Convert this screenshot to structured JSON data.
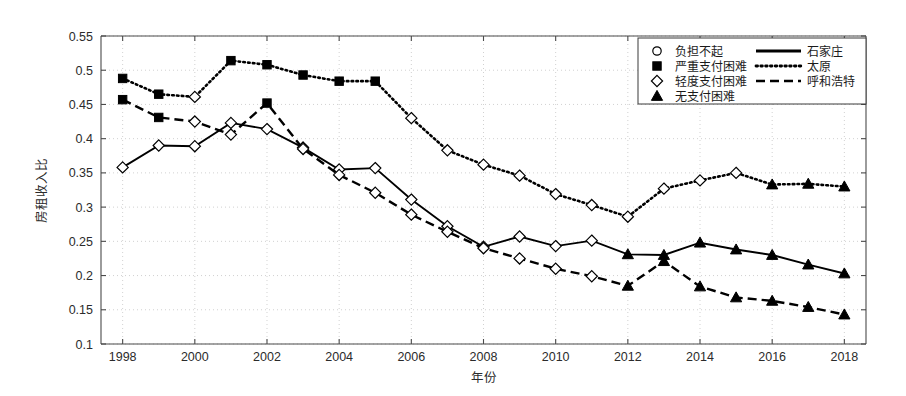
{
  "chart_data": {
    "type": "line",
    "title": "",
    "xlabel": "年份",
    "ylabel": "房租收入比",
    "xlim": [
      1997.4,
      2018.6
    ],
    "ylim": [
      0.1,
      0.55
    ],
    "xticks": [
      "1998",
      "2000",
      "2002",
      "2004",
      "2006",
      "2008",
      "2010",
      "2012",
      "2014",
      "2016",
      "2018"
    ],
    "yticks": [
      "0.1",
      "0.15",
      "0.2",
      "0.25",
      "0.3",
      "0.35",
      "0.4",
      "0.45",
      "0.5",
      "0.55"
    ],
    "grid": true,
    "grid_style": "dotted",
    "legend_position": "top-right",
    "x": [
      1998,
      1999,
      2000,
      2001,
      2002,
      2003,
      2004,
      2005,
      2006,
      2007,
      2008,
      2009,
      2010,
      2011,
      2012,
      2013,
      2014,
      2015,
      2016,
      2017,
      2018
    ],
    "series": [
      {
        "name": "石家庄",
        "line_style": "solid",
        "color": "#000000",
        "values": [
          0.358,
          0.39,
          0.389,
          0.423,
          0.414,
          0.387,
          0.355,
          0.357,
          0.311,
          0.272,
          0.242,
          0.257,
          0.243,
          0.251,
          0.231,
          0.23,
          0.248,
          0.238,
          0.23,
          0.216,
          0.203
        ],
        "markers": [
          "diamond",
          "diamond",
          "diamond",
          "diamond",
          "diamond",
          "diamond",
          "diamond",
          "diamond",
          "diamond",
          "diamond",
          "diamond",
          "diamond",
          "diamond",
          "diamond",
          "triangle",
          "triangle",
          "triangle",
          "triangle",
          "triangle",
          "triangle",
          "triangle"
        ]
      },
      {
        "name": "太原",
        "line_style": "dotted",
        "color": "#000000",
        "values": [
          0.488,
          0.465,
          0.461,
          0.514,
          0.508,
          0.493,
          0.484,
          0.484,
          0.43,
          0.383,
          0.362,
          0.346,
          0.319,
          0.303,
          0.286,
          0.327,
          0.339,
          0.35,
          0.333,
          0.334,
          0.33
        ],
        "markers": [
          "square",
          "square",
          "diamond",
          "square",
          "square",
          "square",
          "square",
          "square",
          "diamond",
          "diamond",
          "diamond",
          "diamond",
          "diamond",
          "diamond",
          "diamond",
          "diamond",
          "diamond",
          "diamond",
          "triangle",
          "triangle",
          "triangle"
        ]
      },
      {
        "name": "呼和浩特",
        "line_style": "dashed",
        "color": "#000000",
        "values": [
          0.457,
          0.431,
          0.425,
          0.406,
          0.452,
          0.385,
          0.347,
          0.321,
          0.289,
          0.264,
          0.24,
          0.225,
          0.21,
          0.199,
          0.185,
          0.221,
          0.184,
          0.168,
          0.163,
          0.154,
          0.143
        ],
        "markers": [
          "square",
          "square",
          "diamond",
          "diamond",
          "square",
          "diamond",
          "diamond",
          "diamond",
          "diamond",
          "diamond",
          "diamond",
          "diamond",
          "diamond",
          "diamond",
          "triangle",
          "triangle",
          "triangle",
          "triangle",
          "triangle",
          "triangle",
          "triangle"
        ]
      }
    ],
    "marker_legend": [
      {
        "marker": "circle",
        "label": "负担不起"
      },
      {
        "marker": "square",
        "label": "严重支付困难"
      },
      {
        "marker": "diamond",
        "label": "轻度支付困难"
      },
      {
        "marker": "triangle",
        "label": "无支付困难"
      }
    ],
    "line_legend": [
      {
        "style": "solid",
        "label": "石家庄"
      },
      {
        "style": "dotted",
        "label": "太原"
      },
      {
        "style": "dashed",
        "label": "呼和浩特"
      }
    ]
  }
}
